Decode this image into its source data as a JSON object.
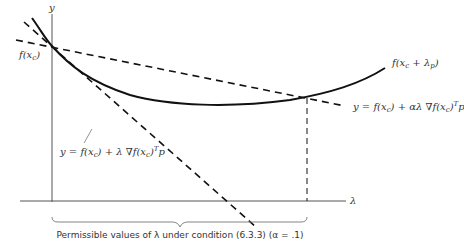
{
  "figure": {
    "axes": {
      "y_label": "y",
      "x_label": "λ",
      "y_intercept_label": "f(x_c)"
    },
    "curve_label": "f(x_c + λ_p)",
    "tangent_line_label": "y = f(x_c) + λ ∇f(x_c)^T p",
    "sufficient_decrease_line_label": "y = f(x_c) + αλ ∇f(x_c)^T p",
    "brace_caption": "Permissible values of λ under condition (6.3.3) (α = .1)",
    "colors": {
      "line": "#111111",
      "text": "#333333",
      "axis": "#555555"
    }
  }
}
